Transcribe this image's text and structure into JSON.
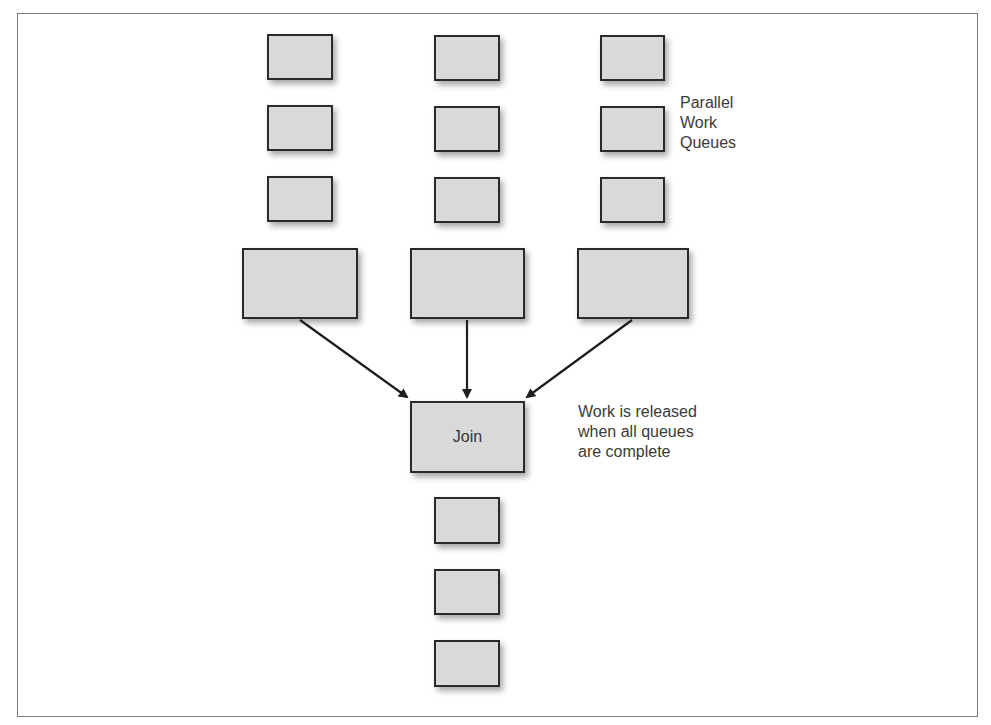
{
  "diagram": {
    "type": "fork-join",
    "labels": {
      "queues_label": [
        "Parallel",
        "Work",
        "Queues"
      ],
      "join_note": [
        "Work is released",
        "when all queues",
        "are complete"
      ]
    },
    "join_box": {
      "label": "Join"
    },
    "columns": [
      {
        "small_boxes": [
          {
            "x": 267,
            "y": 34,
            "w": 66,
            "h": 46
          },
          {
            "x": 267,
            "y": 105,
            "w": 66,
            "h": 46
          },
          {
            "x": 267,
            "y": 176,
            "w": 66,
            "h": 46
          }
        ],
        "large_box": {
          "x": 242,
          "y": 248,
          "w": 116,
          "h": 71
        }
      },
      {
        "small_boxes": [
          {
            "x": 434,
            "y": 35,
            "w": 66,
            "h": 46
          },
          {
            "x": 434,
            "y": 106,
            "w": 66,
            "h": 46
          },
          {
            "x": 434,
            "y": 177,
            "w": 66,
            "h": 46
          }
        ],
        "large_box": {
          "x": 410,
          "y": 248,
          "w": 115,
          "h": 71
        }
      },
      {
        "small_boxes": [
          {
            "x": 600,
            "y": 35,
            "w": 65,
            "h": 46
          },
          {
            "x": 600,
            "y": 106,
            "w": 65,
            "h": 46
          },
          {
            "x": 600,
            "y": 177,
            "w": 65,
            "h": 46
          }
        ],
        "large_box": {
          "x": 577,
          "y": 248,
          "w": 112,
          "h": 71
        }
      }
    ],
    "join": {
      "x": 410,
      "y": 401,
      "w": 115,
      "h": 72
    },
    "output_boxes": [
      {
        "x": 434,
        "y": 497,
        "w": 66,
        "h": 47
      },
      {
        "x": 434,
        "y": 569,
        "w": 66,
        "h": 46
      },
      {
        "x": 434,
        "y": 640,
        "w": 66,
        "h": 47
      }
    ],
    "edges": [
      {
        "from": "col1-large",
        "to": "join",
        "x1": 300,
        "y1": 320,
        "x2": 407,
        "y2": 397
      },
      {
        "from": "col2-large",
        "to": "join",
        "x1": 467,
        "y1": 320,
        "x2": 467,
        "y2": 397
      },
      {
        "from": "col3-large",
        "to": "join",
        "x1": 632,
        "y1": 320,
        "x2": 527,
        "y2": 397
      }
    ],
    "colors": {
      "box_fill": "#d9d9d9",
      "box_border": "#2a2a2a",
      "text": "#3a3a3a",
      "frame": "#7a7a7a"
    }
  }
}
